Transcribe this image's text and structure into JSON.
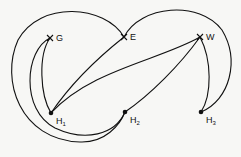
{
  "diagram": {
    "type": "graph",
    "nodes": [
      {
        "id": "G",
        "label": "G",
        "kind": "cross",
        "x": 50,
        "y": 38
      },
      {
        "id": "E",
        "label": "E",
        "kind": "cross",
        "x": 124,
        "y": 37
      },
      {
        "id": "W",
        "label": "W",
        "kind": "cross",
        "x": 200,
        "y": 37
      },
      {
        "id": "H1",
        "label": "H",
        "sub": "1",
        "kind": "dot",
        "x": 51,
        "y": 113
      },
      {
        "id": "H2",
        "label": "H",
        "sub": "2",
        "kind": "dot",
        "x": 125,
        "y": 112
      },
      {
        "id": "H3",
        "label": "H",
        "sub": "3",
        "kind": "dot",
        "x": 201,
        "y": 112
      }
    ],
    "edges": [
      [
        "G",
        "H1"
      ],
      [
        "G",
        "H2"
      ],
      [
        "E",
        "H1"
      ],
      [
        "E",
        "H2"
      ],
      [
        "W",
        "H1"
      ],
      [
        "W",
        "H2"
      ],
      [
        "W",
        "H3"
      ],
      [
        "E",
        "H3"
      ],
      [
        "G",
        "H2"
      ]
    ]
  }
}
